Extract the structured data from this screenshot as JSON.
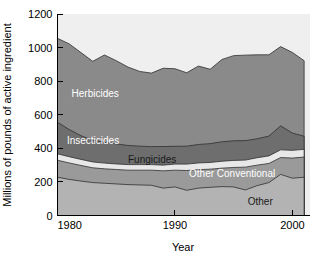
{
  "chart_data": {
    "type": "area",
    "stacked": true,
    "title": "",
    "xlabel": "Year",
    "ylabel": "Millions of pounds of active ingredient",
    "xlim": [
      1980,
      2001.5
    ],
    "ylim": [
      0,
      1200
    ],
    "xticks": [
      1980,
      1990,
      2000
    ],
    "xtick_labels": [
      "1980",
      "1990",
      "2000"
    ],
    "yticks": [
      0,
      200,
      400,
      600,
      800,
      1000,
      1200
    ],
    "ytick_labels": [
      "0",
      "200",
      "400",
      "600",
      "800",
      "1000",
      "1200"
    ],
    "grid": false,
    "legend": "inline-labels",
    "x": [
      1980,
      1981,
      1982,
      1983,
      1984,
      1985,
      1986,
      1987,
      1988,
      1989,
      1990,
      1991,
      1992,
      1993,
      1994,
      1995,
      1996,
      1997,
      1998,
      1999,
      2000,
      2001
    ],
    "series": [
      {
        "name": "Other",
        "label": "Other",
        "color": "#b3b3b3",
        "label_color": "#1a1a1a",
        "label_x": 1996.2,
        "label_y": 60,
        "values": [
          228,
          215,
          205,
          196,
          192,
          188,
          184,
          182,
          180,
          163,
          170,
          150,
          163,
          168,
          172,
          170,
          152,
          178,
          196,
          245,
          222,
          228
        ]
      },
      {
        "name": "Other Conventional",
        "label": "Other Conventional",
        "color": "#9a9a9a",
        "label_color": "#ffffff",
        "label_x": 1991.2,
        "label_y": 228,
        "values": [
          101,
          98,
          93,
          88,
          86,
          86,
          86,
          88,
          90,
          103,
          100,
          118,
          110,
          108,
          110,
          116,
          136,
          122,
          114,
          100,
          120,
          120
        ]
      },
      {
        "name": "Fungicides",
        "label": "Fungicides",
        "color": "#e8e8e8",
        "label_color": "#1a1a1a",
        "label_x": 1986.0,
        "label_y": 312,
        "values": [
          38,
          37,
          36,
          35,
          34,
          33,
          33,
          33,
          33,
          34,
          36,
          38,
          40,
          40,
          41,
          42,
          42,
          44,
          45,
          46,
          46,
          46
        ]
      },
      {
        "name": "Insecticides",
        "label": "Insecticides",
        "color": "#6e6e6e",
        "label_color": "#ffffff",
        "label_x": 1980.8,
        "label_y": 424,
        "values": [
          188,
          162,
          141,
          129,
          124,
          120,
          114,
          110,
          107,
          111,
          106,
          107,
          110,
          112,
          116,
          117,
          116,
          113,
          118,
          143,
          103,
          78
        ]
      },
      {
        "name": "Herbicides",
        "label": "Herbicides",
        "color": "#8a8a8a",
        "label_color": "#ffffff",
        "label_x": 1981.2,
        "label_y": 705,
        "values": [
          500,
          510,
          495,
          470,
          520,
          495,
          467,
          445,
          438,
          466,
          462,
          437,
          467,
          443,
          490,
          507,
          509,
          500,
          484,
          472,
          480,
          450
        ]
      }
    ],
    "totals": [
      1055,
      1022,
      970,
      918,
      956,
      922,
      884,
      858,
      848,
      877,
      874,
      850,
      890,
      871,
      929,
      952,
      955,
      957,
      957,
      1006,
      971,
      922
    ]
  },
  "figure": {
    "background_color": "#ffffff",
    "plot_top_band_color": "#efefef",
    "axis_color": "#000000"
  }
}
